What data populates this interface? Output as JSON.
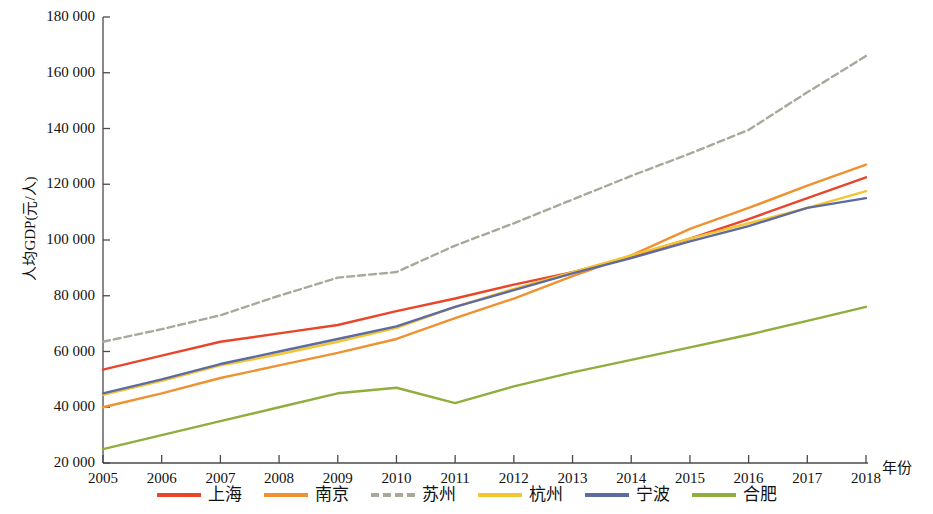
{
  "chart_data": {
    "type": "line",
    "title": "",
    "xlabel": "年份",
    "ylabel": "人均GDP(元/人)",
    "x": [
      2005,
      2006,
      2007,
      2008,
      2009,
      2010,
      2011,
      2012,
      2013,
      2014,
      2015,
      2016,
      2017,
      2018
    ],
    "categories": [
      "2005",
      "2006",
      "2007",
      "2008",
      "2009",
      "2010",
      "2011",
      "2012",
      "2013",
      "2014",
      "2015",
      "2016",
      "2017",
      "2018"
    ],
    "xlim": [
      2005,
      2018
    ],
    "ylim": [
      20000,
      180000
    ],
    "yticks": [
      20000,
      40000,
      60000,
      80000,
      100000,
      120000,
      140000,
      160000,
      180000
    ],
    "ytick_labels": [
      "20 000",
      "40 000",
      "60 000",
      "80 000",
      "100 000",
      "120 000",
      "140 000",
      "160 000",
      "180 000"
    ],
    "grid": false,
    "legend_position": "bottom",
    "series": [
      {
        "name": "上海",
        "color": "#E8452A",
        "style": "solid",
        "values": [
          53500,
          58500,
          63500,
          66500,
          69500,
          74500,
          79000,
          84000,
          88500,
          94000,
          100500,
          107500,
          115000,
          122500
        ]
      },
      {
        "name": "南京",
        "color": "#EF9130",
        "style": "solid",
        "values": [
          40000,
          45000,
          50500,
          55000,
          59500,
          64500,
          72000,
          79000,
          87000,
          94500,
          104000,
          111500,
          119500,
          127000
        ]
      },
      {
        "name": "苏州",
        "color": "#A9A89C",
        "style": "dashed",
        "values": [
          63500,
          68000,
          73000,
          80000,
          86500,
          88500,
          98000,
          106000,
          114500,
          123000,
          131000,
          139500,
          153000,
          166000
        ]
      },
      {
        "name": "杭州",
        "color": "#F5C531",
        "style": "solid",
        "values": [
          44500,
          49500,
          55000,
          59000,
          63500,
          68500,
          76000,
          82500,
          88500,
          94500,
          100500,
          106000,
          111500,
          117500
        ]
      },
      {
        "name": "宁波",
        "color": "#5D6BA1",
        "style": "solid",
        "values": [
          45000,
          50000,
          55500,
          60000,
          64500,
          69000,
          76000,
          82000,
          88000,
          93500,
          99500,
          105000,
          111500,
          115000
        ]
      },
      {
        "name": "合肥",
        "color": "#8FAE3D",
        "style": "solid",
        "values": [
          25000,
          30000,
          35000,
          40000,
          45000,
          47000,
          41500,
          47500,
          52500,
          57000,
          61500,
          66000,
          71000,
          76000
        ]
      }
    ]
  },
  "axes": {
    "y_title": "人均GDP(元/人)",
    "x_title": "年份"
  },
  "legend": {
    "entries": [
      {
        "label": "上海",
        "color": "#E8452A",
        "style": "solid"
      },
      {
        "label": "南京",
        "color": "#EF9130",
        "style": "solid"
      },
      {
        "label": "苏州",
        "color": "#A9A89C",
        "style": "dashed"
      },
      {
        "label": "杭州",
        "color": "#F5C531",
        "style": "solid"
      },
      {
        "label": "宁波",
        "color": "#5D6BA1",
        "style": "solid"
      },
      {
        "label": "合肥",
        "color": "#8FAE3D",
        "style": "solid"
      }
    ]
  }
}
